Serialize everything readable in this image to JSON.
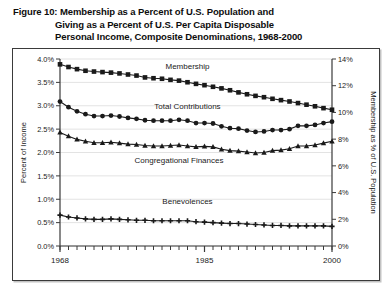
{
  "figure": {
    "caption_lines": [
      "Figure 10:  Membership as a Percent of U.S. Population and",
      "Giving as a Percent of U.S. Per Capita Disposable",
      "Personal Income, Composite Denominations, 1968-2000"
    ]
  },
  "chart_data": {
    "type": "line",
    "title": "Figure 10:  Membership as a Percent of U.S. Population and Giving as a Percent of U.S. Per Capita Disposable Personal Income, Composite Denominations, 1968-2000",
    "xlabel": "",
    "ylabel": "Percent of Income",
    "y2label": "Membership as % of U.S. Population",
    "xlim": [
      1968,
      2000
    ],
    "ylim": [
      0.0,
      4.0
    ],
    "y2lim": [
      0,
      14
    ],
    "grid": true,
    "legend_position": "inline-labels",
    "xticks": [
      1968,
      1985,
      2000
    ],
    "xtick_labels": [
      "1968",
      "1985",
      "2000"
    ],
    "yticks": [
      0.0,
      0.5,
      1.0,
      1.5,
      2.0,
      2.5,
      3.0,
      3.5,
      4.0
    ],
    "ytick_labels": [
      "0.0%",
      "0.5%",
      "1.0%",
      "1.5%",
      "2.0%",
      "2.5%",
      "3.0%",
      "3.5%",
      "4.0%"
    ],
    "y2ticks": [
      0,
      2,
      4,
      6,
      8,
      10,
      12,
      14
    ],
    "y2tick_labels": [
      "0%",
      "2%",
      "4%",
      "6%",
      "8%",
      "10%",
      "12%",
      "14%"
    ],
    "x": [
      1968,
      1969,
      1970,
      1971,
      1972,
      1973,
      1974,
      1975,
      1976,
      1977,
      1978,
      1979,
      1980,
      1981,
      1982,
      1983,
      1984,
      1985,
      1986,
      1987,
      1988,
      1989,
      1990,
      1991,
      1992,
      1993,
      1994,
      1995,
      1996,
      1997,
      1998,
      1999,
      2000
    ],
    "series": [
      {
        "name": "Membership",
        "axis": "right",
        "marker": "square",
        "units": "percent of U.S. population",
        "values": [
          13.6,
          13.4,
          13.24,
          13.12,
          13.06,
          13.02,
          12.98,
          12.92,
          12.84,
          12.76,
          12.62,
          12.56,
          12.52,
          12.44,
          12.38,
          12.26,
          12.14,
          12.04,
          11.92,
          11.8,
          11.66,
          11.5,
          11.36,
          11.24,
          11.14,
          11.02,
          10.92,
          10.82,
          10.7,
          10.58,
          10.46,
          10.32,
          10.2
        ]
      },
      {
        "name": "Total Contributions",
        "axis": "left",
        "marker": "circle",
        "units": "percent of income",
        "values": [
          3.09,
          2.97,
          2.88,
          2.82,
          2.78,
          2.78,
          2.79,
          2.77,
          2.74,
          2.72,
          2.69,
          2.68,
          2.68,
          2.68,
          2.7,
          2.68,
          2.63,
          2.63,
          2.62,
          2.56,
          2.52,
          2.51,
          2.47,
          2.44,
          2.45,
          2.48,
          2.48,
          2.5,
          2.57,
          2.57,
          2.59,
          2.63,
          2.66
        ]
      },
      {
        "name": "Congregational Finances",
        "axis": "left",
        "marker": "triangle",
        "units": "percent of income",
        "values": [
          2.43,
          2.35,
          2.28,
          2.24,
          2.21,
          2.21,
          2.22,
          2.2,
          2.18,
          2.17,
          2.15,
          2.14,
          2.14,
          2.15,
          2.16,
          2.14,
          2.12,
          2.13,
          2.12,
          2.07,
          2.04,
          2.03,
          2.01,
          1.99,
          2.0,
          2.04,
          2.05,
          2.08,
          2.14,
          2.14,
          2.16,
          2.2,
          2.24
        ]
      },
      {
        "name": "Benevolences",
        "axis": "left",
        "marker": "plus",
        "units": "percent of income",
        "values": [
          0.66,
          0.62,
          0.6,
          0.58,
          0.57,
          0.57,
          0.58,
          0.57,
          0.56,
          0.55,
          0.55,
          0.54,
          0.54,
          0.54,
          0.54,
          0.54,
          0.52,
          0.51,
          0.5,
          0.49,
          0.48,
          0.48,
          0.47,
          0.46,
          0.45,
          0.44,
          0.44,
          0.43,
          0.43,
          0.43,
          0.43,
          0.43,
          0.42
        ]
      }
    ],
    "annotations": [
      {
        "text": "Membership",
        "x": 1983.0,
        "y_left": 3.78
      },
      {
        "text": "Total Contributions",
        "x": 1983.0,
        "y_left": 2.92
      },
      {
        "text": "Congregational Finances",
        "x": 1982.0,
        "y_left": 1.77
      },
      {
        "text": "Benevolences",
        "x": 1983.0,
        "y_left": 0.9
      }
    ]
  },
  "colors": {
    "line": "#1a1a1a",
    "grid": "#e3e3e3",
    "axis": "#3a3a3a",
    "frame": "#3a3a3a",
    "background": "#ffffff"
  }
}
